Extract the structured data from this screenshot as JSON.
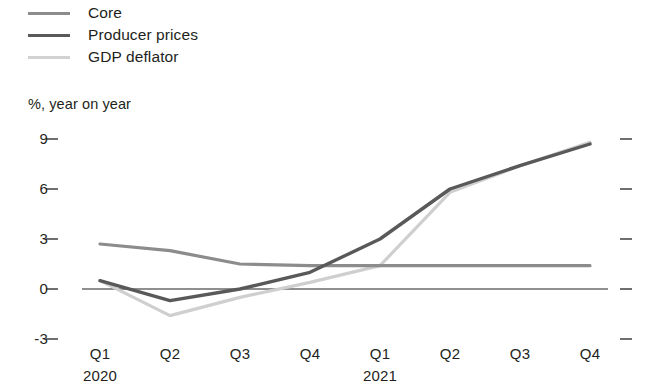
{
  "chart_data": {
    "type": "line",
    "title": "",
    "subtitle": "",
    "ylabel": "%, year on year",
    "xlabel": "",
    "grid": false,
    "legend_position": "top-left",
    "ylim": [
      -3,
      9
    ],
    "yticks": [
      "9",
      "6",
      "3",
      "0",
      "-3"
    ],
    "ytick_values": [
      9,
      6,
      3,
      0,
      -3
    ],
    "categories": [
      "Q1",
      "Q2",
      "Q3",
      "Q4",
      "Q1",
      "Q2",
      "Q3",
      "Q4"
    ],
    "year_groups": [
      {
        "label": "2020",
        "at_category_index": 0
      },
      {
        "label": "2021",
        "at_category_index": 4
      }
    ],
    "zero_line": 0,
    "series": [
      {
        "name": "Core",
        "color": "#8c8c8c",
        "width": 3.2,
        "values": [
          2.7,
          2.3,
          1.5,
          1.4,
          1.4,
          1.4,
          1.4,
          1.4
        ]
      },
      {
        "name": "Producer prices",
        "color": "#595959",
        "width": 3.4,
        "values": [
          0.5,
          -0.7,
          0.0,
          1.0,
          3.0,
          6.0,
          7.4,
          8.7
        ]
      },
      {
        "name": "GDP deflator",
        "color": "#cfcfcf",
        "width": 3.2,
        "values": [
          0.5,
          -1.6,
          -0.5,
          0.4,
          1.4,
          5.8,
          7.4,
          8.8
        ]
      }
    ]
  },
  "legend": {
    "items": [
      {
        "label": "Core",
        "color": "#8c8c8c",
        "width": 3.2
      },
      {
        "label": "Producer prices",
        "color": "#595959",
        "width": 3.8
      },
      {
        "label": "GDP deflator",
        "color": "#d2d2d2",
        "width": 3.2
      }
    ]
  },
  "axes": {
    "y_caption": "%, year on year",
    "y_tick_labels": [
      "9",
      "6",
      "3",
      "0",
      "-3"
    ],
    "x_tick_labels": [
      "Q1",
      "Q2",
      "Q3",
      "Q4",
      "Q1",
      "Q2",
      "Q3",
      "Q4"
    ],
    "x_year_labels": [
      "2020",
      "2021"
    ]
  },
  "colors": {
    "core": "#8c8c8c",
    "producer_prices": "#595959",
    "gdp_deflator": "#cfcfcf",
    "axis": "#231f20",
    "background": "#ffffff"
  }
}
